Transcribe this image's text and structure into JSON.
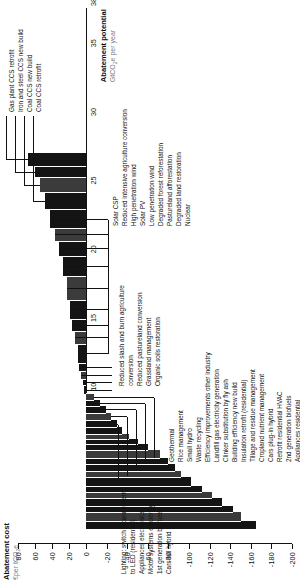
{
  "figure": {
    "orientation": "rotated-90-ccw",
    "y_axis": {
      "title": "Abatement cost",
      "subtitle": "€per tCO2e",
      "ticks": [
        80,
        60,
        40,
        20,
        0,
        -20,
        -40,
        -60,
        -80,
        -100,
        -120,
        -140,
        -160,
        -180,
        -200
      ],
      "min": -200,
      "max": 80
    },
    "x_axis": {
      "title": "Abatement potential",
      "subtitle": "GtCO2e per year",
      "ticks": [
        0,
        5,
        10,
        15,
        20,
        25,
        30,
        35,
        38
      ],
      "min": 0,
      "max": 38
    }
  },
  "chart_data": {
    "type": "bar",
    "xlabel": "Abatement potential GtCO2e per year",
    "ylabel": "Abatement cost €per tCO2e",
    "xlim": [
      0,
      38
    ],
    "ylim": [
      -200,
      80
    ],
    "grid": false,
    "legend": "none",
    "note": "Marginal abatement cost curve: bar width = abatement potential (GtCO2e/yr), bar height = cost (€/tCO2e). Bars sorted from lowest (most negative) cost to highest.",
    "bars": [
      {
        "label": "Appliances residential",
        "width": 0.55,
        "cost": -165
      },
      {
        "label": "2nd generation biofuels",
        "width": 0.7,
        "cost": -150
      },
      {
        "label": "Retrofit residential HVAC",
        "width": 0.45,
        "cost": -143
      },
      {
        "label": "Cars plug-in hybrid",
        "width": 0.55,
        "cost": -132
      },
      {
        "label": "Cropland nutrient management",
        "width": 0.45,
        "cost": -122
      },
      {
        "label": "Tillage and residue management",
        "width": 0.45,
        "cost": -113
      },
      {
        "label": "Insulation retrofit (residential)",
        "width": 0.6,
        "cost": -102
      },
      {
        "label": "Building efficiency new build",
        "width": 0.5,
        "cost": -92
      },
      {
        "label": "Clinker substitution by fly ash",
        "width": 0.45,
        "cost": -86
      },
      {
        "label": "Landfill gas electricity generation",
        "width": 0.45,
        "cost": -80
      },
      {
        "label": "Efficiency improvements other industry",
        "width": 0.6,
        "cost": -72
      },
      {
        "label": "Waste recycling",
        "width": 0.45,
        "cost": -60
      },
      {
        "label": "Small hydro",
        "width": 0.35,
        "cost": -50
      },
      {
        "label": "Rice management",
        "width": 0.4,
        "cost": -42
      },
      {
        "label": "Geothermal",
        "width": 0.45,
        "cost": -35
      },
      {
        "label": "Cars full hybrid",
        "width": 0.55,
        "cost": -30
      },
      {
        "label": "1st generation biofuels",
        "width": 0.5,
        "cost": -24
      },
      {
        "label": "Motor systems efficiency",
        "width": 0.5,
        "cost": -19
      },
      {
        "label": "Appliances electronics",
        "width": 0.45,
        "cost": -14
      },
      {
        "label": "Lighting: switch incandescent to LED (residential)",
        "width": 0.45,
        "cost": -8
      },
      {
        "label": "Organic soils restoration",
        "width": 0.6,
        "cost": 2
      },
      {
        "label": "Grassland management",
        "width": 0.5,
        "cost": 4
      },
      {
        "label": "Reduced pastureland conversion",
        "width": 0.55,
        "cost": 6
      },
      {
        "label": "Reduced slash and burn agriculture conversion",
        "width": 0.6,
        "cost": 8
      },
      {
        "label": "Nuclear",
        "width": 1.4,
        "cost": 10
      },
      {
        "label": "Degraded land restoration",
        "width": 0.9,
        "cost": 13
      },
      {
        "label": "Pastureland afforestation",
        "width": 0.9,
        "cost": 16
      },
      {
        "label": "Degraded forest reforestation",
        "width": 1.4,
        "cost": 19
      },
      {
        "label": "Low penetration wind",
        "width": 1.7,
        "cost": 22
      },
      {
        "label": "Solar PV",
        "width": 1.5,
        "cost": 27
      },
      {
        "label": "High penetration wind",
        "width": 1.1,
        "cost": 32
      },
      {
        "label": "Reduced intensive agriculture conversion",
        "width": 0.9,
        "cost": 36
      },
      {
        "label": "Solar CSP",
        "width": 1.4,
        "cost": 42
      },
      {
        "label": "Coal CCS retrofit",
        "width": 1.2,
        "cost": 48
      },
      {
        "label": "Coal CCS new build",
        "width": 1.1,
        "cost": 54
      },
      {
        "label": "Iron and steel CCS new build",
        "width": 0.8,
        "cost": 60
      },
      {
        "label": "Gas plant CCS retrofit",
        "width": 1.0,
        "cost": 68
      }
    ]
  },
  "callouts": {
    "left_group": [
      "Lighting: switch incandescent",
      "to LED (residential)",
      "Appliances electronics",
      "Motor systems efficiency",
      "1st generation biofuels",
      "Cars full hybrid"
    ],
    "agri_group": [
      "Reduced slash and burn agriculture",
      "conversion",
      "Reduced pastureland conversion",
      "Grassland management",
      "Organic soils restoration"
    ],
    "top_group": [
      "Gas plant CCS retrofit",
      "Iron and steel CCS new build",
      "Coal CCS new build",
      "Coal CCS retrofit"
    ],
    "right_upper": [
      "Solar CSP",
      "Reduced intensive agriculture conversion",
      "High penetration wind",
      "Solar PV",
      "Low penetration wind",
      "Degraded forest reforestation",
      "Pastureland afforestation",
      "Degraded land restoration",
      "Nuclear"
    ],
    "centre_group": [
      "Geothermal",
      "Rice management",
      "Small hydro",
      "Waste recycling",
      "Efficiency improvements other industry",
      "Landfill gas electricity generation",
      "Clinker substitution by fly ash",
      "Building efficiency new build",
      "Insulation retrofit (residential)",
      "Tillage and residue management",
      "Cropland nutrient management",
      "Cars plug-in hybrid",
      "Retrofit residential HVAC",
      "2nd generation biofuels",
      "Appliances residential"
    ]
  }
}
